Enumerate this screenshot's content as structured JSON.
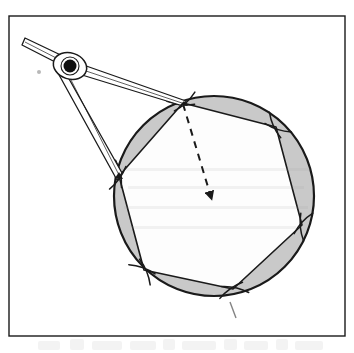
{
  "figure": {
    "type": "geometric-construction-diagram",
    "background_color": "#ffffff",
    "frame": {
      "label": "figure-border",
      "stroke_color": "#1a1a1a",
      "fill_color": "#ffffff",
      "x": 9,
      "y": 16,
      "width": 336,
      "height": 320,
      "stroke_width": 1.4
    },
    "circle": {
      "label": "construction-circle",
      "center_x": 214,
      "center_y": 196,
      "radius": 100,
      "stroke_color": "#1a1a1a",
      "stroke_width": 2.2,
      "fill_color": "#c9c9c9"
    },
    "hexagon": {
      "label": "inscribed-regular-hexagon",
      "sides": 6,
      "fill_color": "#fdfdfd",
      "stroke_color": "#1a1a1a",
      "stroke_width": 1.6,
      "vertices": [
        {
          "name": "vertex-top",
          "x": 183,
          "y": 103
        },
        {
          "name": "vertex-upper-right",
          "x": 276,
          "y": 127
        },
        {
          "name": "vertex-lower-right",
          "x": 302,
          "y": 225
        },
        {
          "name": "vertex-bottom",
          "x": 233,
          "y": 289
        },
        {
          "name": "vertex-bottom-left",
          "x": 144,
          "y": 270
        },
        {
          "name": "vertex-left",
          "x": 119,
          "y": 176
        }
      ]
    },
    "segment_shading": {
      "label": "circular-segments",
      "color": "#c9c9c9",
      "description": "Six shaded circular segments between each hexagon side and the circle arc"
    },
    "radius_line": {
      "label": "dashed-radius",
      "style": "dashed",
      "stroke_color": "#1a1a1a",
      "stroke_width": 2,
      "dash_pattern": "7 6",
      "from_x": 183,
      "from_y": 104,
      "to_x": 211,
      "to_y": 197,
      "arrowhead": true
    },
    "arc_marks": {
      "label": "compass-arc-marks",
      "stroke_color": "#1a1a1a",
      "stroke_width": 1.5,
      "count": 6,
      "description": "Short arc scratches crossing each hexagon vertex where the compass stepped around the circle"
    },
    "compass": {
      "label": "drafting-compass",
      "stroke_color": "#1a1a1a",
      "fill_color": "#ffffff",
      "pivot": {
        "name": "compass-pivot-joint",
        "x": 70,
        "y": 66,
        "radius": 6,
        "color": "#111111"
      },
      "head": {
        "name": "compass-head",
        "x": 70,
        "y": 66,
        "rx": 17,
        "ry": 13
      },
      "handle": {
        "name": "compass-handle",
        "from_x": 26,
        "from_y": 41,
        "to_x": 62,
        "to_y": 61,
        "width": 7
      },
      "leg_pencil": {
        "name": "compass-leg-to-top-vertex",
        "from_x": 70,
        "from_y": 66,
        "to_x": 184,
        "to_y": 104,
        "tip_label": "pencil-tip"
      },
      "leg_point": {
        "name": "compass-leg-to-left-vertex",
        "from_x": 70,
        "from_y": 66,
        "to_x": 120,
        "to_y": 177,
        "tip_label": "needle-point"
      },
      "span_note": "compass opening equals the circle radius"
    },
    "stray_mark": {
      "label": "faint-pencil-dot",
      "x": 39,
      "y": 72,
      "color": "#b8b8b8"
    }
  },
  "caption": {
    "label": "page-caption-smudge",
    "text": "",
    "note": "Blurred partial line of printed text cropped at the bottom of the scanned page"
  }
}
